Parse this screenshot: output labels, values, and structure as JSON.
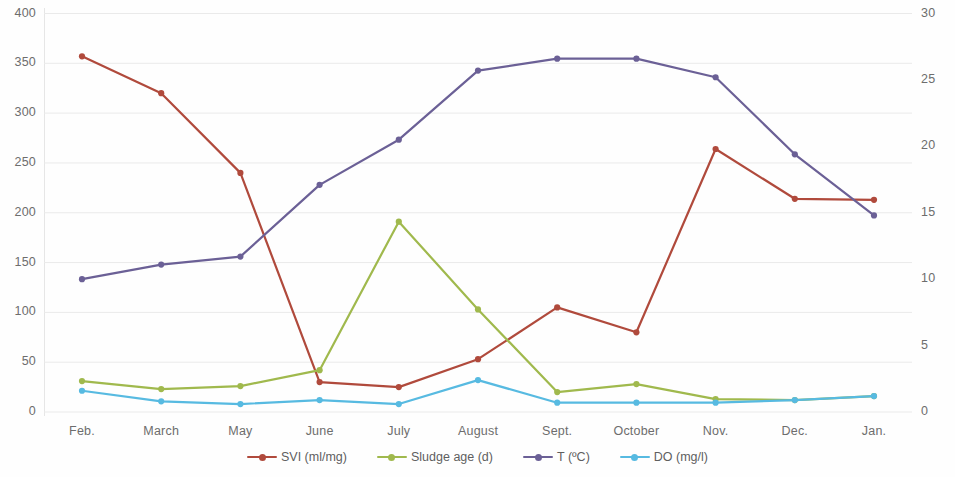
{
  "chart_data": {
    "type": "line",
    "title": "",
    "xlabel": "",
    "ylabel": "",
    "grid": true,
    "legend_position": "bottom",
    "categories": [
      "Feb.",
      "March",
      "May",
      "June",
      "July",
      "August",
      "Sept.",
      "October",
      "Nov.",
      "Dec.",
      "Jan."
    ],
    "axes": {
      "left": {
        "label": "",
        "min": 0,
        "max": 400,
        "step": 50,
        "ticks": [
          "0",
          "50",
          "100",
          "150",
          "200",
          "250",
          "300",
          "350",
          "400"
        ],
        "series": [
          "SVI (ml/mg)",
          "Sludge age (d)"
        ]
      },
      "right": {
        "label": "",
        "min": 0,
        "max": 30,
        "step": 5,
        "ticks": [
          "0",
          "5",
          "10",
          "15",
          "20",
          "25",
          "30"
        ],
        "series": [
          "T (ºC)",
          "DO (mg/l)"
        ]
      }
    },
    "series": [
      {
        "name": "SVI (ml/mg)",
        "axis": "left",
        "color": "#b04a3c",
        "values": [
          357,
          320,
          240,
          30,
          25,
          53,
          105,
          80,
          264,
          214,
          213
        ]
      },
      {
        "name": "Sludge age (d)",
        "axis": "left",
        "color": "#a0b94d",
        "values": [
          31,
          23,
          26,
          42,
          191,
          103,
          20,
          28,
          13,
          12,
          16
        ]
      },
      {
        "name": "T (ºC)",
        "axis": "right",
        "color": "#6b6096",
        "values": [
          10.0,
          11.1,
          11.7,
          17.1,
          20.5,
          25.7,
          26.6,
          26.6,
          25.2,
          19.4,
          14.8
        ]
      },
      {
        "name": "DO (mg/l)",
        "axis": "right",
        "color": "#57bae1",
        "values": [
          1.6,
          0.8,
          0.6,
          0.9,
          0.6,
          2.4,
          0.7,
          0.7,
          0.7,
          0.9,
          1.2
        ]
      }
    ]
  },
  "legend": {
    "items": [
      {
        "label": "SVI (ml/mg)",
        "color": "#b04a3c",
        "icon": "legend-line-marker-icon"
      },
      {
        "label": "Sludge age (d)",
        "color": "#a0b94d",
        "icon": "legend-line-marker-icon"
      },
      {
        "label": "T (ºC)",
        "color": "#6b6096",
        "icon": "legend-line-marker-icon"
      },
      {
        "label": "DO (mg/l)",
        "color": "#57bae1",
        "icon": "legend-line-marker-icon"
      }
    ]
  }
}
